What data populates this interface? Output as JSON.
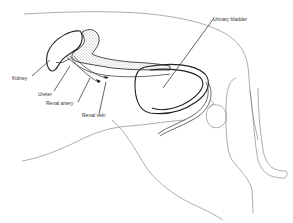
{
  "diagram": {
    "labels": {
      "kidney": "Kidney",
      "ureter": "Ureter",
      "renal_artery": "Renal artery",
      "renal_vein": "Renal vein",
      "urinary_bladder": "Urinary bladder"
    },
    "colors": {
      "line": "#222222",
      "outline": "#777777",
      "stipple": "#555555",
      "background": "#ffffff"
    }
  }
}
